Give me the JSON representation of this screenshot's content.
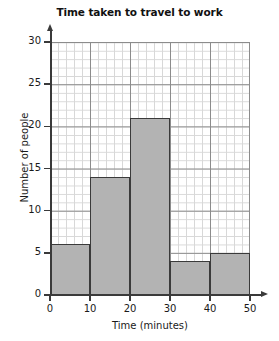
{
  "chart_data": {
    "type": "bar",
    "title": "Time taken to travel to work",
    "xlabel": "Time (minutes)",
    "ylabel": "Number of people",
    "categories": [
      "0-10",
      "10-20",
      "20-30",
      "30-40",
      "40-50"
    ],
    "bin_edges": [
      0,
      10,
      20,
      30,
      40,
      50
    ],
    "values": [
      6,
      14,
      21,
      4,
      5
    ],
    "xlim": [
      0,
      50
    ],
    "ylim": [
      0,
      30
    ],
    "x_ticks": [
      "0",
      "10",
      "20",
      "30",
      "40",
      "50"
    ],
    "y_ticks": [
      "0",
      "5",
      "10",
      "15",
      "20",
      "25",
      "30"
    ],
    "x_tick_values": [
      0,
      10,
      20,
      30,
      40,
      50
    ],
    "y_tick_values": [
      0,
      5,
      10,
      15,
      20,
      25,
      30
    ],
    "grid": "major and minor",
    "minor_grid_x_step": 2,
    "minor_grid_y_step": 1,
    "legend": "none",
    "bar_fill_color": "#b3b3b3",
    "bar_border_color": "#3a3a3a",
    "major_grid_color": "#8c8c8c",
    "minor_grid_color": "#d8d8d8",
    "axis_color": "#3a3a3a",
    "background_color": "#ffffff"
  }
}
